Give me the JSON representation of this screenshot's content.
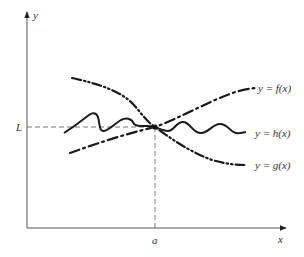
{
  "diagram": {
    "type": "squeeze-theorem-graph",
    "axes": {
      "x_label": "x",
      "y_label": "y"
    },
    "markers": {
      "limit_label": "L",
      "point_label": "a"
    },
    "curves": [
      {
        "id": "f",
        "label": "y = f(x)",
        "style": "dash-dot-dot",
        "description": "increasing curve, lies above h(x) right of a"
      },
      {
        "id": "h",
        "label": "y = h(x)",
        "style": "solid-wavy",
        "description": "oscillating curve squeezed between f and g"
      },
      {
        "id": "g",
        "label": "y = g(x)",
        "style": "dash-dot",
        "description": "decreasing curve, lies below h(x) right of a"
      }
    ],
    "intersection": {
      "x_label": "a",
      "y_label": "L"
    }
  }
}
